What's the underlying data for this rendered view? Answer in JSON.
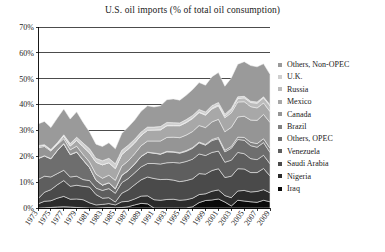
{
  "chart_data": {
    "type": "area",
    "title": "U.S. oil imports (% of total oil consumption)",
    "xlabel": "",
    "ylabel": "",
    "ylim": [
      0,
      70
    ],
    "ytick_labels": [
      "0%",
      "10%",
      "20%",
      "30%",
      "40%",
      "50%",
      "60%",
      "70%"
    ],
    "ytick_values": [
      0,
      10,
      20,
      30,
      40,
      50,
      60,
      70
    ],
    "grid": true,
    "legend_position": "right",
    "stacked": true,
    "stack_order": "bottom-to-top",
    "x": [
      1973,
      1974,
      1975,
      1976,
      1977,
      1978,
      1979,
      1980,
      1981,
      1982,
      1983,
      1984,
      1985,
      1986,
      1987,
      1988,
      1989,
      1990,
      1991,
      1992,
      1993,
      1994,
      1995,
      1996,
      1997,
      1998,
      1999,
      2000,
      2001,
      2002,
      2003,
      2004,
      2005,
      2006,
      2007,
      2008,
      2009
    ],
    "xtick_labels": [
      "1973",
      "1975",
      "1977",
      "1979",
      "1981",
      "1983",
      "1985",
      "1987",
      "1989",
      "1991",
      "1993",
      "1995",
      "1997",
      "1999",
      "2001",
      "2003",
      "2005",
      "2007",
      "2009"
    ],
    "series": [
      {
        "name": "Iraq",
        "color": "#0a0a0a",
        "values": [
          0.0,
          0.1,
          0.2,
          0.4,
          0.5,
          0.4,
          0.2,
          0.1,
          0.0,
          0.0,
          0.1,
          0.2,
          0.1,
          0.2,
          0.5,
          1.2,
          1.8,
          1.6,
          0.0,
          0.0,
          0.0,
          0.0,
          0.0,
          0.0,
          0.5,
          2.1,
          2.9,
          3.1,
          3.5,
          2.3,
          0.8,
          3.0,
          2.7,
          2.4,
          2.2,
          3.0,
          2.4
        ]
      },
      {
        "name": "Nigeria",
        "color": "#2b2b2b",
        "values": [
          1.6,
          2.5,
          2.6,
          3.4,
          4.0,
          3.0,
          3.3,
          3.1,
          2.0,
          1.2,
          1.3,
          1.5,
          1.1,
          2.2,
          2.1,
          2.3,
          2.8,
          3.1,
          3.2,
          3.0,
          3.3,
          3.4,
          3.0,
          3.2,
          3.3,
          3.1,
          2.6,
          3.4,
          3.5,
          2.5,
          3.2,
          3.6,
          4.1,
          3.8,
          4.2,
          4.1,
          3.5
        ]
      },
      {
        "name": "Saudi Arabia",
        "color": "#4a4a4a",
        "values": [
          2.0,
          3.5,
          4.3,
          5.2,
          6.1,
          5.0,
          5.3,
          5.2,
          6.1,
          4.0,
          2.4,
          2.3,
          1.1,
          3.3,
          4.4,
          5.5,
          6.3,
          7.3,
          8.2,
          8.0,
          7.8,
          7.4,
          7.2,
          7.4,
          7.5,
          8.1,
          7.6,
          8.0,
          8.2,
          7.0,
          8.3,
          8.6,
          8.3,
          7.5,
          7.3,
          8.2,
          6.5
        ]
      },
      {
        "name": "Venezuela",
        "color": "#5e5e5e",
        "values": [
          7.4,
          6.2,
          4.9,
          4.3,
          4.0,
          3.6,
          3.5,
          2.6,
          2.5,
          2.5,
          3.0,
          3.5,
          3.4,
          4.1,
          4.4,
          4.6,
          5.0,
          5.2,
          5.8,
          6.0,
          6.4,
          6.8,
          7.2,
          7.4,
          7.6,
          7.6,
          7.2,
          7.0,
          6.8,
          5.9,
          6.2,
          6.3,
          5.9,
          5.4,
          5.0,
          5.1,
          4.7
        ]
      },
      {
        "name": "Others, OPEC",
        "color": "#6e6e6e",
        "values": [
          8.1,
          7.8,
          7.0,
          8.9,
          10.2,
          8.6,
          9.3,
          7.5,
          5.0,
          3.0,
          2.0,
          2.2,
          1.7,
          2.8,
          3.0,
          3.4,
          4.0,
          4.3,
          4.0,
          3.8,
          4.2,
          4.0,
          3.8,
          3.9,
          4.2,
          4.3,
          4.0,
          4.6,
          4.8,
          4.0,
          4.6,
          5.0,
          5.2,
          5.0,
          4.8,
          4.9,
          4.4
        ]
      },
      {
        "name": "Brazil",
        "color": "#808080",
        "values": [
          0.1,
          0.1,
          0.1,
          0.1,
          0.1,
          0.1,
          0.1,
          0.1,
          0.1,
          0.1,
          0.1,
          0.1,
          0.1,
          0.1,
          0.1,
          0.1,
          0.1,
          0.1,
          0.1,
          0.1,
          0.2,
          0.2,
          0.2,
          0.3,
          0.3,
          0.3,
          0.3,
          0.4,
          0.5,
          0.6,
          0.7,
          0.9,
          1.1,
          1.3,
          1.4,
          1.5,
          1.6
        ]
      },
      {
        "name": "Canada",
        "color": "#959595",
        "values": [
          4.1,
          3.6,
          2.9,
          2.2,
          1.9,
          1.8,
          2.2,
          2.1,
          2.1,
          2.3,
          2.6,
          2.9,
          3.2,
          3.5,
          3.7,
          3.9,
          4.1,
          4.3,
          4.6,
          5.0,
          5.4,
          5.6,
          5.8,
          6.0,
          6.2,
          6.4,
          6.5,
          6.8,
          7.0,
          7.2,
          7.4,
          7.8,
          8.2,
          8.6,
          9.0,
          9.4,
          10.0
        ]
      },
      {
        "name": "Mexico",
        "color": "#a8a8a8",
        "values": [
          0.6,
          0.5,
          0.4,
          0.4,
          1.0,
          1.5,
          2.3,
          3.0,
          3.5,
          4.6,
          5.2,
          4.8,
          4.6,
          4.5,
          4.6,
          4.2,
          4.0,
          4.2,
          4.3,
          4.3,
          4.5,
          4.4,
          4.6,
          4.8,
          5.0,
          5.0,
          4.8,
          5.0,
          5.2,
          5.4,
          5.6,
          5.8,
          5.6,
          5.2,
          4.8,
          4.4,
          4.2
        ]
      },
      {
        "name": "Russia",
        "color": "#bcbcbc",
        "values": [
          0.0,
          0.0,
          0.0,
          0.0,
          0.0,
          0.0,
          0.0,
          0.0,
          0.0,
          0.0,
          0.0,
          0.0,
          0.0,
          0.0,
          0.0,
          0.0,
          0.0,
          0.0,
          0.0,
          0.1,
          0.1,
          0.1,
          0.1,
          0.2,
          0.2,
          0.2,
          0.2,
          0.3,
          0.4,
          0.6,
          1.0,
          1.3,
          1.5,
          1.6,
          1.8,
          2.0,
          2.2
        ]
      },
      {
        "name": "U.K.",
        "color": "#cfcfcf",
        "values": [
          0.2,
          0.2,
          0.2,
          0.3,
          0.5,
          0.9,
          1.2,
          1.4,
          1.6,
          1.5,
          1.6,
          1.7,
          1.8,
          1.6,
          1.5,
          1.4,
          1.3,
          1.2,
          1.1,
          1.2,
          1.2,
          1.1,
          1.0,
          1.0,
          1.0,
          1.0,
          1.0,
          1.0,
          0.9,
          0.8,
          0.7,
          0.7,
          0.6,
          0.5,
          0.5,
          0.4,
          0.4
        ]
      },
      {
        "name": "Others, Non-OPEC",
        "color": "#9a9a9a",
        "values": [
          8.4,
          9.0,
          8.5,
          9.6,
          10.0,
          9.5,
          9.8,
          8.0,
          6.5,
          5.5,
          5.5,
          6.0,
          5.8,
          6.5,
          7.0,
          7.4,
          8.0,
          8.2,
          7.8,
          8.0,
          8.8,
          9.2,
          8.8,
          9.4,
          10.0,
          10.4,
          10.4,
          11.2,
          11.6,
          10.8,
          11.8,
          12.6,
          13.4,
          13.8,
          13.6,
          12.8,
          11.8
        ]
      }
    ]
  },
  "legend": {
    "items": [
      {
        "label": "Others, Non-OPEC",
        "color": "#9a9a9a"
      },
      {
        "label": "U.K.",
        "color": "#cfcfcf"
      },
      {
        "label": "Russia",
        "color": "#bcbcbc"
      },
      {
        "label": "Mexico",
        "color": "#a8a8a8"
      },
      {
        "label": "Canada",
        "color": "#959595"
      },
      {
        "label": "Brazil",
        "color": "#808080"
      },
      {
        "label": "Others, OPEC",
        "color": "#6e6e6e"
      },
      {
        "label": "Venezuela",
        "color": "#5e5e5e"
      },
      {
        "label": "Saudi Arabia",
        "color": "#4a4a4a"
      },
      {
        "label": "Nigeria",
        "color": "#2b2b2b"
      },
      {
        "label": "Iraq",
        "color": "#0a0a0a"
      }
    ]
  }
}
